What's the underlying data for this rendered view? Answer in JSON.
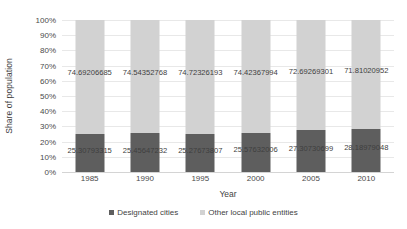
{
  "chart_data": {
    "type": "bar",
    "subtype": "100% stacked column",
    "title": "",
    "xlabel": "Year",
    "ylabel": "Share of population",
    "categories": [
      "1985",
      "1990",
      "1995",
      "2000",
      "2005",
      "2010"
    ],
    "ylim": [
      0,
      100
    ],
    "ytick_labels": [
      "0%",
      "10%",
      "20%",
      "30%",
      "40%",
      "50%",
      "60%",
      "70%",
      "80%",
      "90%",
      "100%"
    ],
    "ytick_values": [
      0,
      10,
      20,
      30,
      40,
      50,
      60,
      70,
      80,
      90,
      100
    ],
    "grid": true,
    "legend_position": "bottom",
    "series": [
      {
        "name": "Designated cities",
        "color": "#5e5e5e",
        "values": [
          25.30793315,
          25.45647232,
          25.27673807,
          25.57632006,
          27.30730699,
          28.18979048
        ],
        "labels": [
          "25.30793315",
          "25.45647232",
          "25.27673807",
          "25.57632006",
          "27.30730699",
          "28.18979048"
        ]
      },
      {
        "name": "Other local public entities",
        "color": "#d2d2d2",
        "values": [
          74.69206685,
          74.54352768,
          74.72326193,
          74.42367994,
          72.69269301,
          71.81020952
        ],
        "labels": [
          "74.69206685",
          "74.54352768",
          "74.72326193",
          "74.42367994",
          "72.69269301",
          "71.81020952"
        ]
      }
    ]
  },
  "legend": {
    "items": [
      {
        "label": "Designated cities",
        "color": "#5e5e5e"
      },
      {
        "label": "Other local public entities",
        "color": "#d2d2d2"
      }
    ]
  },
  "colors": {
    "designated_cities": "#5e5e5e",
    "other_local_public_entities": "#d2d2d2",
    "gridline": "#e8e8e8",
    "text": "#3f3f3f",
    "background": "#ffffff"
  }
}
